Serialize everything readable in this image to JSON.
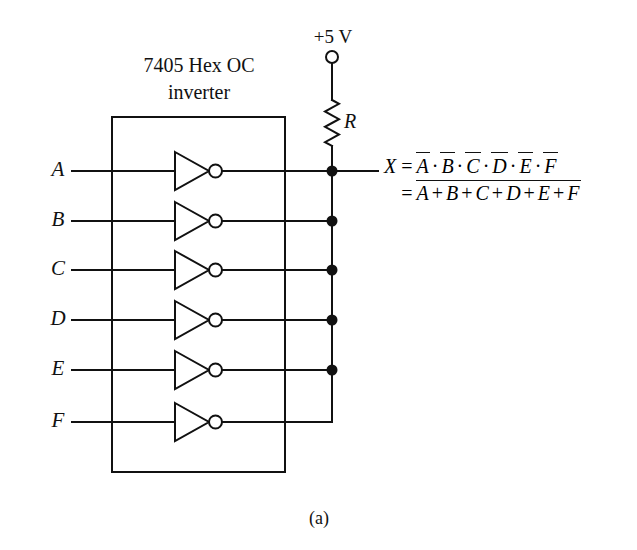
{
  "figure": {
    "caption": "(a)",
    "ic_title": "7405 Hex OC inverter",
    "supply_label": "+5 V",
    "resistor_label": "R",
    "output_label": "X"
  },
  "inputs": [
    {
      "label": "A",
      "y": 171,
      "has_bus_dot": true
    },
    {
      "label": "B",
      "y": 221,
      "has_bus_dot": true
    },
    {
      "label": "C",
      "y": 270,
      "has_bus_dot": true
    },
    {
      "label": "D",
      "y": 320,
      "has_bus_dot": true
    },
    {
      "label": "E",
      "y": 370,
      "has_bus_dot": true
    },
    {
      "label": "F",
      "y": 422,
      "has_bus_dot": false
    }
  ],
  "equation": {
    "lhs": "X",
    "equals": "=",
    "line1": {
      "terms": [
        "A",
        "B",
        "C",
        "D",
        "E",
        "F"
      ],
      "operator": "·",
      "each_term_overbarred": true
    },
    "line2": {
      "terms": [
        "A",
        "B",
        "C",
        "D",
        "E",
        "F"
      ],
      "operator": "+",
      "whole_expression_overbarred": true
    }
  },
  "geometry": {
    "ic_box": {
      "x": 112,
      "y": 117,
      "w": 173,
      "h": 355
    },
    "bus_x": 332,
    "supply_node": {
      "x": 332,
      "y": 57,
      "r": 6
    },
    "resistor": {
      "x": 332,
      "top": 100,
      "bottom": 146
    },
    "output_lead_end": 378,
    "label_x": 58,
    "input_wire_start": 72,
    "gate": {
      "tri_left": 175,
      "tri_right": 209,
      "half_h": 19,
      "bubble_r": 6.5
    }
  },
  "style": {
    "stroke": "#111111",
    "background": "#ffffff",
    "line_width": 2,
    "dot_radius": 5.5
  }
}
